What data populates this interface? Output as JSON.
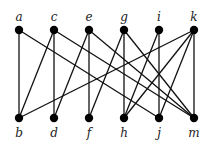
{
  "diagram": {
    "type": "bipartite-graph",
    "top_nodes": [
      {
        "id": "a",
        "label": "a",
        "x": 19,
        "y": 30
      },
      {
        "id": "c",
        "label": "c",
        "x": 54,
        "y": 30
      },
      {
        "id": "e",
        "label": "e",
        "x": 89,
        "y": 30
      },
      {
        "id": "g",
        "label": "g",
        "x": 124,
        "y": 30
      },
      {
        "id": "i",
        "label": "i",
        "x": 159,
        "y": 30
      },
      {
        "id": "k",
        "label": "k",
        "x": 194,
        "y": 30
      }
    ],
    "bottom_nodes": [
      {
        "id": "b",
        "label": "b",
        "x": 19,
        "y": 118
      },
      {
        "id": "d",
        "label": "d",
        "x": 54,
        "y": 118
      },
      {
        "id": "f",
        "label": "f",
        "x": 89,
        "y": 118
      },
      {
        "id": "h",
        "label": "h",
        "x": 124,
        "y": 118
      },
      {
        "id": "j",
        "label": "j",
        "x": 159,
        "y": 118
      },
      {
        "id": "m",
        "label": "m",
        "x": 194,
        "y": 118
      }
    ],
    "edges": [
      [
        "a",
        "b"
      ],
      [
        "a",
        "j"
      ],
      [
        "c",
        "b"
      ],
      [
        "c",
        "d"
      ],
      [
        "c",
        "m"
      ],
      [
        "e",
        "d"
      ],
      [
        "e",
        "f"
      ],
      [
        "e",
        "m"
      ],
      [
        "g",
        "f"
      ],
      [
        "g",
        "h"
      ],
      [
        "g",
        "m"
      ],
      [
        "i",
        "h"
      ],
      [
        "i",
        "j"
      ],
      [
        "k",
        "b"
      ],
      [
        "k",
        "h"
      ],
      [
        "k",
        "j"
      ],
      [
        "k",
        "m"
      ]
    ]
  }
}
